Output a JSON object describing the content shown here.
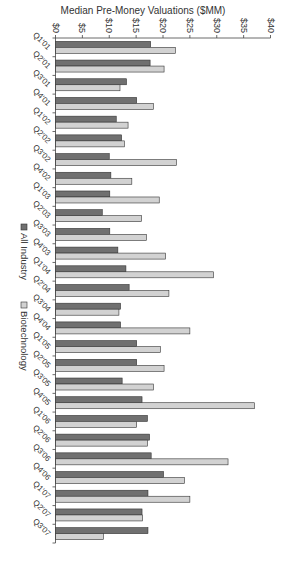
{
  "chart_data": {
    "type": "bar",
    "orientation": "vertical (image rotated 90 degrees clockwise)",
    "title": "",
    "xlabel": "",
    "ylabel": "Median Pre-Money Valuations ($MM)",
    "ylim": [
      0,
      40
    ],
    "yticks": [
      "$0",
      "$5",
      "$10",
      "$15",
      "$20",
      "$25",
      "$30",
      "$35",
      "$40"
    ],
    "grid": false,
    "legend_position": "bottom",
    "categories": [
      "Q1'01",
      "Q2'01",
      "Q3'01",
      "Q4'01",
      "Q1'02",
      "Q2'02",
      "Q3'02",
      "Q4'02",
      "Q1'03",
      "Q2'03",
      "Q3'03",
      "Q4'03",
      "Q1'04",
      "Q2'04",
      "Q3'04",
      "Q4'04",
      "Q1'05",
      "Q2'05",
      "Q3'05",
      "Q4'05",
      "Q1'06",
      "Q2'06",
      "Q3'06",
      "Q4'06",
      "Q1'07",
      "Q2'07",
      "Q3'07"
    ],
    "series": [
      {
        "name": "All Industry",
        "color": "#707070",
        "values": [
          17.7,
          17.6,
          13.2,
          15.1,
          11.3,
          12.3,
          10.0,
          10.3,
          10.1,
          8.7,
          10.1,
          11.6,
          13.1,
          13.7,
          12.1,
          12.1,
          15.1,
          15.1,
          12.4,
          16.1,
          17.1,
          17.5,
          17.8,
          20.1,
          17.2,
          16.1,
          17.2
        ]
      },
      {
        "name": "Biotechnology",
        "color": "#d2d2d2",
        "values": [
          22.3,
          20.2,
          12.0,
          18.2,
          13.5,
          12.8,
          22.5,
          14.2,
          19.3,
          16.0,
          16.9,
          20.5,
          29.4,
          21.1,
          11.8,
          25.0,
          19.5,
          20.2,
          18.2,
          37.0,
          15.1,
          17.1,
          32.1,
          24.0,
          25.0,
          16.2,
          8.9
        ]
      }
    ]
  },
  "legend": {
    "items": [
      {
        "label": "All Industry",
        "color": "#707070"
      },
      {
        "label": "Biotechnology",
        "color": "#d2d2d2"
      }
    ]
  }
}
